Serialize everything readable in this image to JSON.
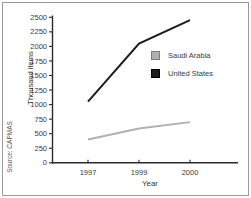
{
  "chart_data": {
    "type": "line",
    "categories": [
      "1997",
      "1999",
      "2000"
    ],
    "series": [
      {
        "name": "Saudi Arabia",
        "values": [
          400,
          590,
          700
        ],
        "color": "#b0b0b0",
        "swatch_border": "#7d7d7d",
        "stroke_width": 1.8
      },
      {
        "name": "United States",
        "values": [
          1050,
          2050,
          2450
        ],
        "color": "#1d1d1d",
        "swatch_border": "#000000",
        "stroke_width": 2
      }
    ],
    "title": "",
    "xlabel": "Year",
    "ylabel": "Thousand items",
    "ylim": [
      0,
      2500
    ],
    "ytick_step": 250,
    "grid": false,
    "legend_position": "inside-right",
    "source": "Source: CAPMAS"
  },
  "colors": {
    "axis": "#2b2b2b",
    "tick_text": "#3a3a3a",
    "frame_border": "#9b9b9b",
    "background": "#ffffff"
  }
}
